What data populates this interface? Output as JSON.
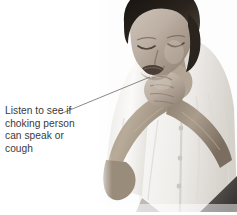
{
  "figure": {
    "name": "choking-first-aid-illustration",
    "background_color": "#ffffff",
    "width": 237,
    "height": 215
  },
  "caption": {
    "text_color": "#3a3a3a",
    "lines": [
      "Listen to see if",
      "choking person",
      "can speak or",
      "cough"
    ],
    "full_text": "Listen to see if choking person can speak or cough"
  },
  "leader_line": {
    "color": "#6b6b6b",
    "from_label": "caption-end",
    "to_label": "mouth-of-choking-person",
    "x1": 60,
    "y1": 114,
    "x2": 150,
    "y2": 77
  },
  "photo": {
    "subject": "woman clutching her throat with both hands, the universal choking sign",
    "palette": {
      "hair_dark": "#1a1715",
      "hair_mid": "#3b3531",
      "skin_light": "#d8cfc7",
      "skin_mid": "#b5a89d",
      "skin_shadow": "#8e8077",
      "shirt_white": "#f4f2ef",
      "shirt_shadow": "#cfcbc5",
      "skirt_dark": "#4e4b49",
      "backdrop": "#fdfdfd"
    },
    "regions": [
      "hair",
      "face",
      "closed-eyes",
      "open-mouth",
      "neck",
      "left-hand",
      "right-hand",
      "forearms",
      "white-short-sleeve-shirt",
      "shirt-buttons",
      "dark-skirt"
    ]
  }
}
